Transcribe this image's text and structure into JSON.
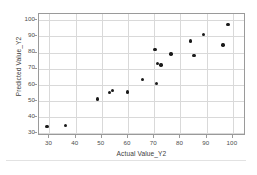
{
  "chart_data": {
    "type": "scatter",
    "title": "",
    "xlabel": "Actual Value_Y2",
    "ylabel": "Predicted Value_Y2",
    "xlim": [
      26,
      105
    ],
    "ylim": [
      28,
      104
    ],
    "xticks": [
      30,
      40,
      50,
      60,
      70,
      80,
      90,
      100
    ],
    "yticks": [
      30,
      40,
      50,
      60,
      70,
      80,
      90,
      100
    ],
    "grid": true,
    "legend": false,
    "marker_color": "#1a1a1a",
    "marker": "circle",
    "points": [
      {
        "x": 29.0,
        "y": 34.0
      },
      {
        "x": 36.0,
        "y": 34.5
      },
      {
        "x": 48.3,
        "y": 51.0
      },
      {
        "x": 52.8,
        "y": 55.0
      },
      {
        "x": 54.0,
        "y": 56.3
      },
      {
        "x": 59.8,
        "y": 55.3
      },
      {
        "x": 65.5,
        "y": 63.2
      },
      {
        "x": 70.2,
        "y": 82.0
      },
      {
        "x": 70.8,
        "y": 60.8
      },
      {
        "x": 71.2,
        "y": 73.0
      },
      {
        "x": 72.6,
        "y": 72.3
      },
      {
        "x": 76.4,
        "y": 79.0
      },
      {
        "x": 83.7,
        "y": 87.2
      },
      {
        "x": 85.2,
        "y": 78.0
      },
      {
        "x": 88.8,
        "y": 91.2
      },
      {
        "x": 96.2,
        "y": 84.6
      },
      {
        "x": 98.1,
        "y": 97.6
      }
    ]
  },
  "footer": {
    "caption": ""
  }
}
